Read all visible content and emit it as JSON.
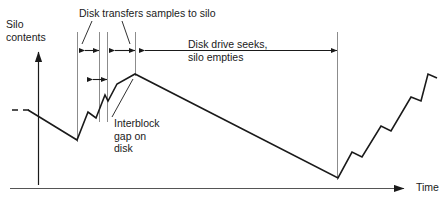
{
  "figure": {
    "type": "timing-diagram",
    "title_label": "",
    "axes": {
      "y_label_line1": "Silo",
      "y_label_line2": "contents",
      "x_label": "Time"
    },
    "annotations": {
      "transfers": "Disk transfers samples to silo",
      "seeks_line1": "Disk drive seeks,",
      "seeks_line2": "silo empties",
      "interblock_line1": "Interblock",
      "interblock_line2": "gap on",
      "interblock_line3": "disk"
    },
    "colors": {
      "ink": "#1a1a1a",
      "guide": "#808080",
      "background": "#ffffff"
    }
  },
  "chart_data": {
    "type": "line",
    "xlabel": "Time",
    "ylabel": "Silo contents",
    "grid": false,
    "legend": "none",
    "phases": [
      {
        "name": "drain-before",
        "x_start": 12,
        "x_end": 77,
        "trend": "decreasing"
      },
      {
        "name": "disk-transfers-samples-to-silo",
        "x_start": 77,
        "x_end": 135,
        "trend": "increasing-sawtooth"
      },
      {
        "name": "disk-drive-seeks-silo-empties",
        "x_start": 135,
        "x_end": 338,
        "trend": "decreasing"
      },
      {
        "name": "refill-sawtooth",
        "x_start": 338,
        "x_end": 435,
        "trend": "increasing-sawtooth"
      }
    ],
    "waveform_points": [
      [
        12,
        110
      ],
      [
        28,
        110
      ],
      [
        77,
        140
      ],
      [
        88,
        112
      ],
      [
        96,
        118
      ],
      [
        105,
        95
      ],
      [
        108,
        101
      ],
      [
        117,
        84
      ],
      [
        135,
        74
      ],
      [
        338,
        178
      ],
      [
        352,
        152
      ],
      [
        362,
        157
      ],
      [
        381,
        126
      ],
      [
        391,
        131
      ],
      [
        411,
        97
      ],
      [
        421,
        101
      ],
      [
        428,
        74
      ],
      [
        437,
        78
      ]
    ],
    "dashed_segment": {
      "x_start": 12,
      "x_end": 28,
      "y": 110
    },
    "measure_bars": [
      {
        "name": "block-1",
        "x_start": 77,
        "x_end": 99,
        "y": 50,
        "arrows": "both"
      },
      {
        "name": "block-2",
        "x_start": 107,
        "x_end": 135,
        "y": 50,
        "arrows": "both"
      },
      {
        "name": "interblock-gap",
        "x_start": 85,
        "x_end": 107,
        "y": 79,
        "arrows": "both"
      },
      {
        "name": "seek-period",
        "x_start": 137,
        "x_end": 337,
        "y": 50,
        "arrows": "both"
      }
    ],
    "guide_lines": [
      {
        "name": "guide-block1-start",
        "x": 77,
        "y_top": 32,
        "y_bottom": 142
      },
      {
        "name": "guide-block1-end",
        "x": 99,
        "y_top": 32,
        "y_bottom": 122
      },
      {
        "name": "guide-block2-start",
        "x": 107,
        "y_top": 32,
        "y_bottom": 122
      },
      {
        "name": "guide-block2-end",
        "x": 135,
        "y_top": 32,
        "y_bottom": 76
      },
      {
        "name": "guide-seek-end",
        "x": 337,
        "y_top": 32,
        "y_bottom": 180
      }
    ],
    "leader_lines": [
      {
        "name": "leader-transfers-left",
        "from": [
          92,
          21
        ],
        "to": [
          82,
          44
        ]
      },
      {
        "name": "leader-transfers-right",
        "from": [
          122,
          21
        ],
        "to": [
          130,
          44
        ]
      },
      {
        "name": "leader-interblock",
        "from": [
          112,
          117
        ],
        "to": [
          133,
          79
        ]
      }
    ]
  }
}
